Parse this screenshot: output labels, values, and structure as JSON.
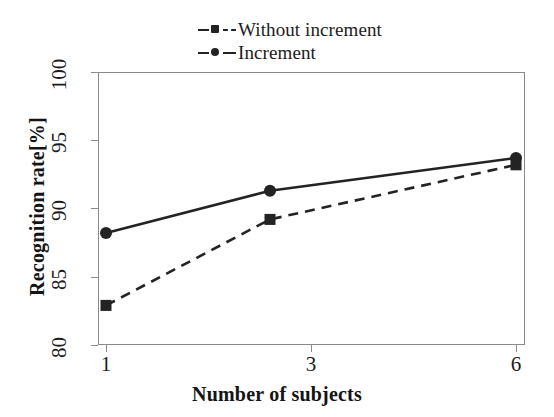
{
  "chart_data": {
    "type": "line",
    "title": "",
    "xlabel": "Number of subjects",
    "ylabel": "Recognition rate[%]",
    "categories": [
      "1",
      "3",
      "6"
    ],
    "x": [
      1,
      3,
      6
    ],
    "xtick_labels": [
      "1",
      "3",
      "6"
    ],
    "ytick_labels": [
      "80",
      "85",
      "90",
      "95",
      "100"
    ],
    "yticks": [
      80,
      85,
      90,
      95,
      100
    ],
    "xlim": [
      1,
      6
    ],
    "ylim": [
      80,
      100
    ],
    "grid": false,
    "legend_position": "top-center",
    "series": [
      {
        "name": "Without increment",
        "values": [
          82.9,
          89.2,
          93.2
        ],
        "line_style": "dashed",
        "marker": "square",
        "color": "#232323"
      },
      {
        "name": "Increment",
        "values": [
          88.2,
          91.3,
          93.7
        ],
        "line_style": "solid",
        "marker": "circle",
        "color": "#232323"
      }
    ]
  },
  "legend": {
    "items": [
      {
        "label": "Without increment",
        "style": "dashed",
        "marker": "square"
      },
      {
        "label": "Increment",
        "style": "solid",
        "marker": "circle"
      }
    ]
  },
  "axes": {
    "y_title": "Recognition rate[%]",
    "x_title": "Number of subjects",
    "y_ticks": [
      "100",
      "95",
      "90",
      "85",
      "80"
    ],
    "x_ticks": [
      "1",
      "3",
      "6"
    ]
  }
}
